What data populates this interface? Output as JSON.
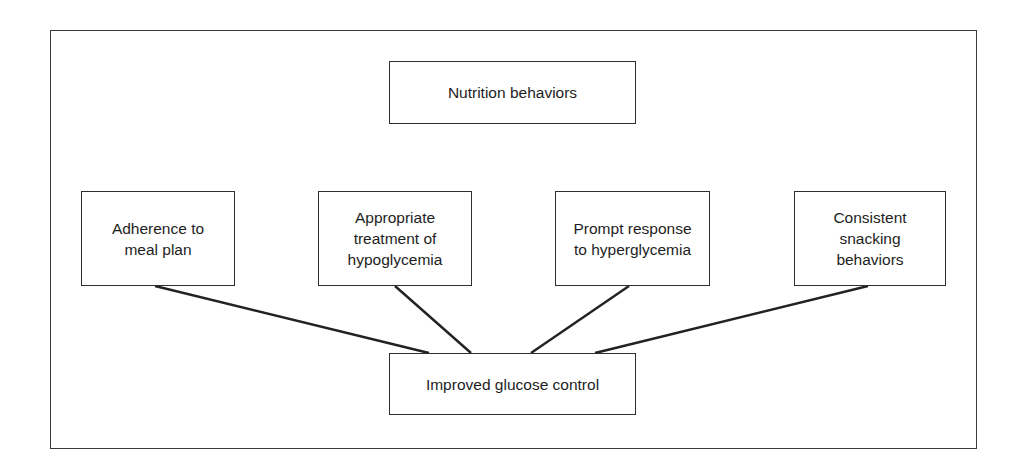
{
  "diagram": {
    "top_node": {
      "label": "Nutrition behaviors"
    },
    "behaviors": [
      {
        "label": "Adherence to\nmeal plan"
      },
      {
        "label": "Appropriate\ntreatment of\nhypoglycemia"
      },
      {
        "label": "Prompt response\nto hyperglycemia"
      },
      {
        "label": "Consistent\nsnacking\nbehaviors"
      }
    ],
    "outcome_node": {
      "label": "Improved glucose control"
    },
    "edges": [
      {
        "from": "Adherence to meal plan",
        "to": "Improved glucose control"
      },
      {
        "from": "Appropriate treatment of hypoglycemia",
        "to": "Improved glucose control"
      },
      {
        "from": "Prompt response to hyperglycemia",
        "to": "Improved glucose control"
      },
      {
        "from": "Consistent snacking behaviors",
        "to": "Improved glucose control"
      }
    ],
    "colors": {
      "line": "#222222",
      "text": "#1e1e1e",
      "background": "#ffffff"
    }
  }
}
